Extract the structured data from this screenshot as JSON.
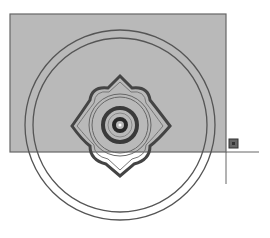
{
  "canvas": {
    "width": 270,
    "height": 238,
    "background": "#ffffff"
  },
  "colors": {
    "stroke": "#555555",
    "fill_rect": "#b8b8b8",
    "rect_border": "#666666",
    "grip": "#555555"
  },
  "drawing": {
    "rect": {
      "x": 10,
      "y": 14,
      "w": 216,
      "h": 138
    },
    "center": {
      "x": 120,
      "y": 125
    },
    "outer_circles": [
      95,
      87
    ],
    "mid_circles": [
      31,
      29
    ],
    "inner_rings": [
      18,
      15
    ],
    "core_radius": 4,
    "crosshair": {
      "x": 226,
      "y": 152,
      "hlen": 32,
      "vlen": 32
    },
    "grip": {
      "x": 229,
      "y": 139,
      "size": 9
    }
  }
}
